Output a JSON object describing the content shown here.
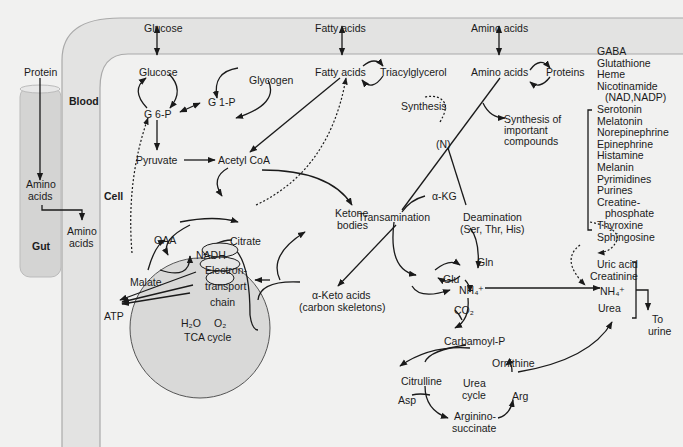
{
  "figure": {
    "compartments": {
      "blood": "Blood",
      "cell": "Cell",
      "gut": "Gut"
    },
    "blood_band": {
      "glucose": "Glucose",
      "fatty_acids": "Fatty acids",
      "amino_acids": "Amino acids"
    },
    "gut": {
      "protein": "Protein",
      "amino_acids_1": "Amino",
      "amino_acids_2": "acids",
      "out_1": "Amino",
      "out_2": "acids"
    },
    "carbohydrate": {
      "glucose": "Glucose",
      "g6p": "G 6-P",
      "g1p": "G 1-P",
      "glycogen": "Glycogen",
      "pyruvate": "Pyruvate",
      "acetyl_coa": "Acetyl CoA"
    },
    "lipid": {
      "fatty_acids": "Fatty acids",
      "triacylglycerol": "Triacylglycerol",
      "ketone_1": "Ketone",
      "ketone_2": "bodies"
    },
    "tca": {
      "oaa": "OAA",
      "nadh": "NADH",
      "citrate": "Citrate",
      "malate": "Malate",
      "etc_1": "Electron-",
      "etc_2": "transport",
      "etc_3": "chain",
      "h2o": "H₂O",
      "o2": "O₂",
      "label": "TCA cycle",
      "atp": "ATP"
    },
    "amino": {
      "amino_acids": "Amino acids",
      "proteins": "Proteins",
      "synthesis": "Synthesis",
      "synthesis_important_1": "Synthesis of",
      "synthesis_important_2": "important",
      "synthesis_important_3": "compounds",
      "nitrogen": "(N)",
      "akg": "α-KG",
      "transamination": "Transamination",
      "deamination": "Deamination",
      "deamination_aa": "(Ser, Thr, His)",
      "keto_1": "α-Keto acids",
      "keto_2": "(carbon skeletons)",
      "glu": "Glu",
      "gln": "Gln",
      "nh4": "NH₄⁺",
      "co2": "CO₂",
      "carbamoyl": "Carbamoyl-P"
    },
    "urea_cycle": {
      "citrulline": "Citrulline",
      "ornithine": "Ornithine",
      "arg": "Arg",
      "asp": "Asp",
      "argininosuccinate_1": "Arginino-",
      "argininosuccinate_2": "succinate",
      "label_1": "Urea",
      "label_2": "cycle"
    },
    "excretion": {
      "uric_acid": "Uric acid",
      "creatinine": "Creatinine",
      "nh4": "NH₄⁺",
      "urea": "Urea",
      "to_urine_1": "To",
      "to_urine_2": "urine"
    },
    "important_compounds": [
      "GABA",
      "Glutathione",
      "Heme",
      "Nicotinamide",
      "(NAD,NADP)",
      "Serotonin",
      "Melatonin",
      "Norepinephrine",
      "Epinephrine",
      "Histamine",
      "Melanin",
      "Pyrimidines",
      "Purines",
      "Creatine-",
      "phosphate",
      "Thyroxine",
      "Sphingosine"
    ]
  }
}
